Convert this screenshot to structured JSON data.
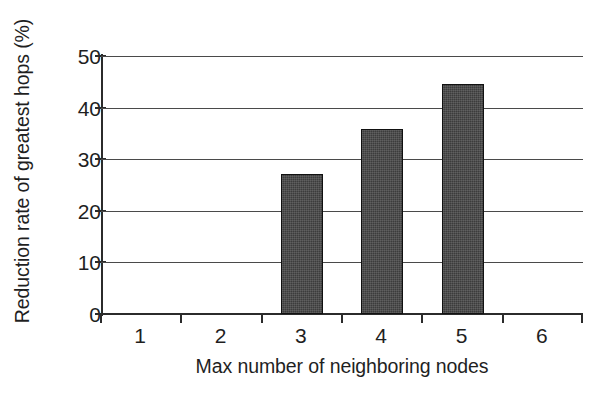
{
  "chart_data": {
    "type": "bar",
    "title": "",
    "xlabel": "Max number of neighboring nodes",
    "ylabel": "Reduction rate of greatest hops (%)",
    "categories": [
      "1",
      "2",
      "3",
      "4",
      "5",
      "6"
    ],
    "values": [
      0,
      0,
      27.2,
      35.9,
      44.5,
      0
    ],
    "ylim": [
      0,
      50
    ],
    "ytick_labels": [
      "0",
      "10",
      "20",
      "30",
      "40",
      "50"
    ],
    "ytick_values": [
      0,
      10,
      20,
      30,
      40,
      50
    ],
    "xtick_labels": [
      "1",
      "2",
      "3",
      "4",
      "5",
      "6"
    ],
    "grid": true,
    "legend": "none",
    "bar_color": "#3c3c3c",
    "bar_edge_color": "#111111",
    "gridline_color": "#4a4a4a",
    "axis_color": "#2b2b2b",
    "background_color": "#ffffff"
  },
  "axes": {
    "y_title": "Reduction rate of greatest hops (%)",
    "x_title": "Max number of neighboring nodes"
  }
}
